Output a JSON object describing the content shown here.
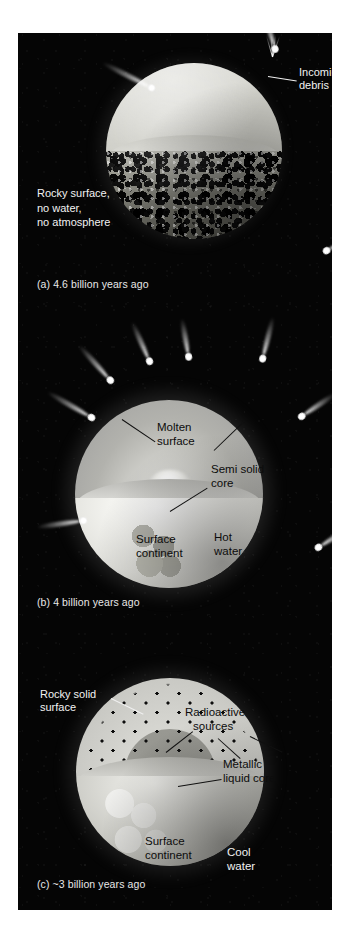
{
  "figure": {
    "background_color": "#050505",
    "panels": [
      {
        "id": "a",
        "caption": "(a) 4.6 billion years ago",
        "labels": [
          {
            "name": "incoming-debris",
            "text_lines": [
              "Incoming",
              "debris"
            ],
            "color": "#f2f2f2"
          },
          {
            "name": "rocky-surface",
            "text_lines": [
              "Rocky surface,",
              "no water,",
              "no atmosphere"
            ],
            "color": "#f2f2f2"
          }
        ],
        "sphere": {
          "upper_hemisphere": "pale grey molten-free cut face",
          "lower_hemisphere": "rocky cratered crust",
          "cut_plane": "flat equatorial ellipse"
        },
        "debris_count": 3
      },
      {
        "id": "b",
        "caption": "(b) 4 billion years ago",
        "labels": [
          {
            "name": "molten-surface",
            "text_lines": [
              "Molten",
              "surface"
            ],
            "color": "#0c0c0c"
          },
          {
            "name": "semi-solid-core",
            "text_lines": [
              "Semi solid",
              "core"
            ],
            "color": "#0c0c0c"
          },
          {
            "name": "surface-continent",
            "text_lines": [
              "Surface",
              "continent"
            ],
            "color": "#0c0c0c"
          },
          {
            "name": "hot-water",
            "text_lines": [
              "Hot",
              "water"
            ],
            "color": "#0c0c0c"
          }
        ],
        "sphere": {
          "upper_hemisphere": "molten mantle gradient",
          "core": "semi solid glowing core",
          "lower_hemisphere": "hot water ocean with continent"
        },
        "debris_count": 8
      },
      {
        "id": "c",
        "caption": "(c) ~3 billion years ago",
        "labels": [
          {
            "name": "rocky-solid-surface",
            "text_lines": [
              "Rocky solid",
              "surface"
            ],
            "color": "#f2f2f2"
          },
          {
            "name": "radioactive-sources",
            "text_lines": [
              "Radioactive",
              "sources"
            ],
            "color": "#0c0c0c"
          },
          {
            "name": "metallic-liquid-core",
            "text_lines": [
              "Metallic",
              "liquid core"
            ],
            "color": "#0c0c0c"
          },
          {
            "name": "surface-continent",
            "text_lines": [
              "Surface",
              "continent"
            ],
            "color": "#0c0c0c"
          },
          {
            "name": "cool-water",
            "text_lines": [
              "Cool",
              "water"
            ],
            "color": "#f2f2f2"
          }
        ],
        "sphere": {
          "outer_mantle": "light speckled mantle with radioactive dots",
          "inner_mantle": "darker grey inner mantle",
          "core": "bright white metallic liquid core",
          "lower_hemisphere": "cool water ocean with continent"
        },
        "debris_count": 0
      }
    ]
  }
}
